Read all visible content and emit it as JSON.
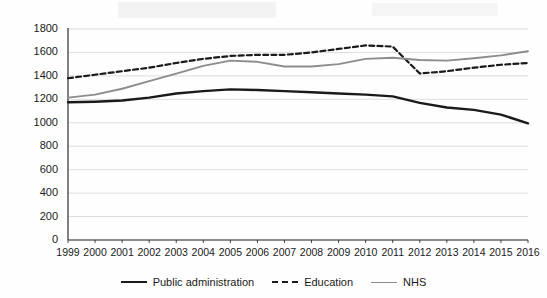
{
  "chart_data": {
    "type": "line",
    "title": "",
    "subtitle": "",
    "xlabel": "",
    "ylabel": "",
    "x": [
      1999,
      2000,
      2001,
      2002,
      2003,
      2004,
      2005,
      2006,
      2007,
      2008,
      2009,
      2010,
      2011,
      2012,
      2013,
      2014,
      2015,
      2016
    ],
    "categories": [
      "1999",
      "2000",
      "2001",
      "2002",
      "2003",
      "2004",
      "2005",
      "2006",
      "2007",
      "2008",
      "2009",
      "2010",
      "2011",
      "2012",
      "2013",
      "2014",
      "2015",
      "2016"
    ],
    "xlim": [
      1999,
      2016
    ],
    "ylim": [
      0,
      1800
    ],
    "yticks": [
      0,
      200,
      400,
      600,
      800,
      1000,
      1200,
      1400,
      1600,
      1800
    ],
    "ytick_labels": [
      "0",
      "200",
      "400",
      "600",
      "800",
      "1000",
      "1200",
      "1400",
      "1600",
      "1800"
    ],
    "grid": "horizontal",
    "legend_position": "bottom",
    "series": [
      {
        "name": "Public administration",
        "style": "solid",
        "color": "#1a1a1a",
        "width": 2.4,
        "values": [
          1175,
          1180,
          1190,
          1215,
          1250,
          1270,
          1285,
          1280,
          1270,
          1260,
          1250,
          1240,
          1225,
          1170,
          1130,
          1110,
          1070,
          995
        ]
      },
      {
        "name": "Education",
        "style": "dashed",
        "color": "#1a1a1a",
        "width": 2.2,
        "values": [
          1380,
          1410,
          1440,
          1470,
          1510,
          1545,
          1570,
          1580,
          1580,
          1600,
          1630,
          1660,
          1650,
          1420,
          1440,
          1470,
          1495,
          1510
        ]
      },
      {
        "name": "NHS",
        "style": "solid",
        "color": "#8c8c8c",
        "width": 1.9,
        "values": [
          1215,
          1240,
          1290,
          1355,
          1420,
          1485,
          1530,
          1520,
          1480,
          1480,
          1500,
          1545,
          1555,
          1535,
          1530,
          1550,
          1575,
          1610
        ]
      }
    ]
  },
  "legend": {
    "items": [
      {
        "label": "Public administration",
        "swatch": "solid-dark"
      },
      {
        "label": "Education",
        "swatch": "dashed-dark"
      },
      {
        "label": "NHS",
        "swatch": "solid-grey"
      }
    ]
  },
  "colors": {
    "axis": "#1a1a1a",
    "grid": "#d9d9d9",
    "background": "#fefefe",
    "public_administration": "#1a1a1a",
    "education": "#1a1a1a",
    "nhs": "#8c8c8c"
  }
}
